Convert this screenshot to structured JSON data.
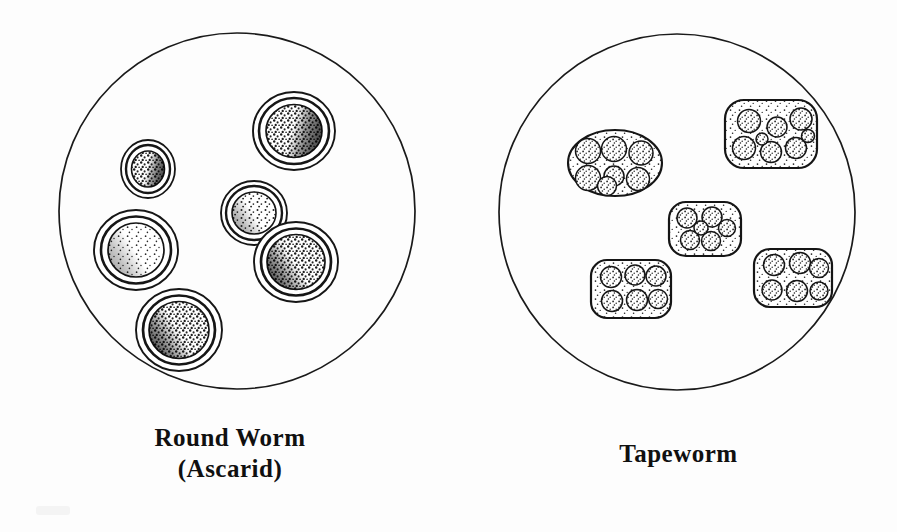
{
  "figure": {
    "background_color": "#fdfdfd",
    "ink_color": "#141414",
    "width": 897,
    "height": 532
  },
  "panels": [
    {
      "id": "roundworm",
      "caption_line1": "Round Worm",
      "caption_line2": "(Ascarid)",
      "field": {
        "shape": "circle",
        "center_x": 237,
        "center_y": 211,
        "radius": 178,
        "stroke_color": "#1a1a1a",
        "stroke_width": 1.6
      },
      "specimen_type": "single-egg",
      "specimen_count": 6,
      "specimens": [
        {
          "name": "egg-upper-right",
          "cx": 294,
          "cy": 131,
          "r": 41,
          "rings": 2,
          "core_r": 28,
          "shade": "stippled-dark-right"
        },
        {
          "name": "egg-small-left",
          "cx": 148,
          "cy": 169,
          "r": 27,
          "rings": 2,
          "core_r": 17,
          "shade": "stippled-dark"
        },
        {
          "name": "egg-mid-left",
          "cx": 136,
          "cy": 250,
          "r": 41,
          "rings": 2,
          "core_r": 28,
          "shade": "stippled-light"
        },
        {
          "name": "egg-center",
          "cx": 254,
          "cy": 213,
          "r": 33,
          "rings": 2,
          "core_r": 22,
          "shade": "stippled-mid"
        },
        {
          "name": "egg-center-right",
          "cx": 296,
          "cy": 262,
          "r": 41,
          "rings": 2,
          "core_r": 29,
          "shade": "stippled-dark-left"
        },
        {
          "name": "egg-bottom",
          "cx": 179,
          "cy": 330,
          "r": 42,
          "rings": 2,
          "core_r": 30,
          "shade": "stippled-dark-left"
        }
      ]
    },
    {
      "id": "tapeworm",
      "caption_line1": "Tapeworm",
      "caption_line2": "",
      "field": {
        "shape": "circle",
        "center_x": 677,
        "center_y": 212,
        "radius": 178,
        "stroke_color": "#1a1a1a",
        "stroke_width": 1.6
      },
      "specimen_type": "egg-packet",
      "specimen_count": 5,
      "specimens": [
        {
          "name": "packet-upper-left",
          "cx": 615,
          "cy": 163,
          "rx": 47,
          "ry": 33,
          "corner": 33,
          "eggs": 7
        },
        {
          "name": "packet-upper-right",
          "cx": 771,
          "cy": 134,
          "rx": 46,
          "ry": 34,
          "corner": 16,
          "eggs": 8
        },
        {
          "name": "packet-center",
          "cx": 705,
          "cy": 229,
          "rx": 36,
          "ry": 27,
          "corner": 15,
          "eggs": 6
        },
        {
          "name": "packet-lower-left",
          "cx": 631,
          "cy": 289,
          "rx": 40,
          "ry": 29,
          "corner": 14,
          "eggs": 6
        },
        {
          "name": "packet-lower-right",
          "cx": 793,
          "cy": 278,
          "rx": 39,
          "ry": 29,
          "corner": 14,
          "eggs": 6
        }
      ]
    }
  ]
}
